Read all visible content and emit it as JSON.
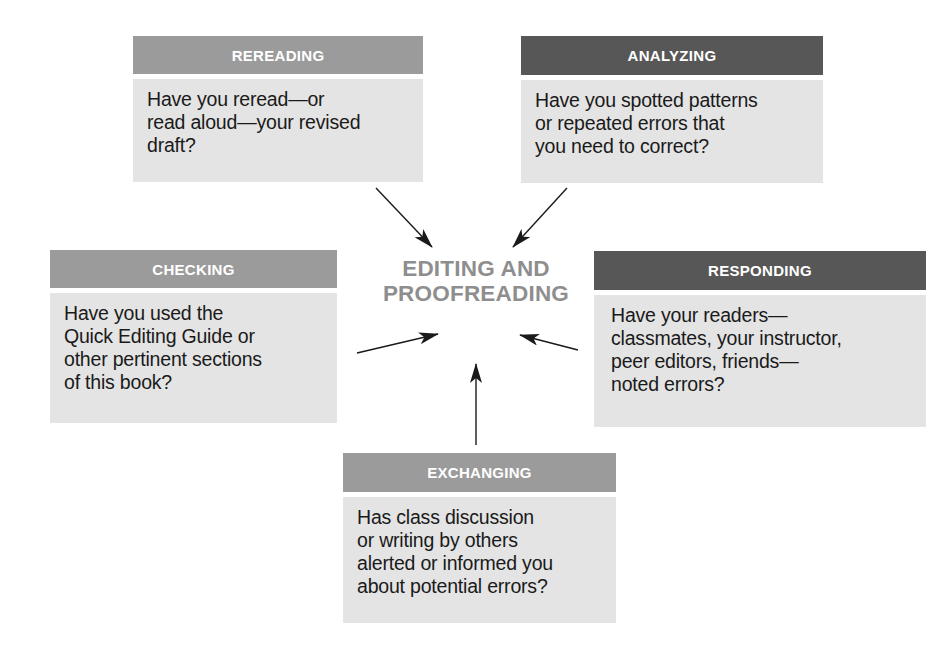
{
  "diagram": {
    "title_lines": [
      "EDITING AND",
      "PROOFREADING"
    ],
    "colors": {
      "header_light": "#9b9b9b",
      "header_dark": "#575757",
      "body_fill": "#e4e4e4",
      "title": "#8e8e8e",
      "arrow": "#1a1a1a"
    },
    "nodes": [
      {
        "id": "rereading",
        "header": "REREADING",
        "style": "light",
        "lines": [
          "Have you reread—or",
          "read aloud—your revised",
          "draft?"
        ]
      },
      {
        "id": "analyzing",
        "header": "ANALYZING",
        "style": "dark",
        "lines": [
          "Have you spotted patterns",
          "or repeated errors that",
          "you need to correct?"
        ]
      },
      {
        "id": "checking",
        "header": "CHECKING",
        "style": "light",
        "lines": [
          "Have you used the",
          "Quick Editing Guide or",
          "other pertinent sections",
          "of this book?"
        ]
      },
      {
        "id": "responding",
        "header": "RESPONDING",
        "style": "dark",
        "lines": [
          "Have your readers—",
          "classmates, your instructor,",
          "peer editors, friends—",
          "noted errors?"
        ]
      },
      {
        "id": "exchanging",
        "header": "EXCHANGING",
        "style": "light",
        "lines": [
          "Has class discussion",
          "or writing by others",
          "alerted or informed you",
          "about potential errors?"
        ]
      }
    ],
    "edges": [
      {
        "from": "rereading",
        "to": "center"
      },
      {
        "from": "analyzing",
        "to": "center"
      },
      {
        "from": "checking",
        "to": "center"
      },
      {
        "from": "responding",
        "to": "center"
      },
      {
        "from": "exchanging",
        "to": "center"
      }
    ]
  }
}
